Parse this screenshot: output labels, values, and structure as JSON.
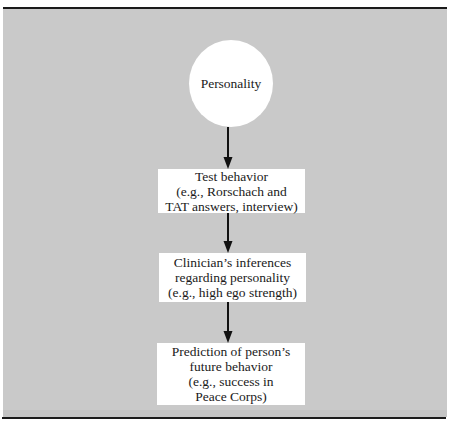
{
  "diagram": {
    "background_color": "#c9c9c9",
    "node_color": "#ffffff",
    "arrow_color": "#111111",
    "nodes": [
      {
        "id": "personality",
        "shape": "circle",
        "lines": [
          "Personality"
        ]
      },
      {
        "id": "test-behavior",
        "shape": "rectangle",
        "lines": [
          "Test behavior",
          "(e.g., Rorschach and",
          "TAT answers, interview)"
        ]
      },
      {
        "id": "clinician-inferences",
        "shape": "rectangle",
        "lines": [
          "Clinician’s inferences",
          "regarding personality",
          "(e.g., high ego strength)"
        ]
      },
      {
        "id": "prediction",
        "shape": "rectangle",
        "lines": [
          "Prediction of person’s",
          "future behavior",
          "(e.g., success in",
          "Peace Corps)"
        ]
      }
    ],
    "edges": [
      {
        "from": "personality",
        "to": "test-behavior"
      },
      {
        "from": "test-behavior",
        "to": "clinician-inferences"
      },
      {
        "from": "clinician-inferences",
        "to": "prediction"
      }
    ]
  }
}
